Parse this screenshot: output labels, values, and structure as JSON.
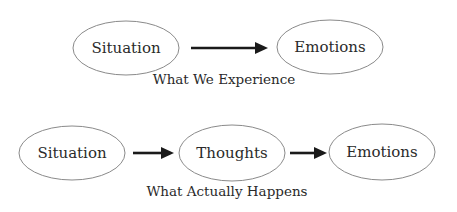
{
  "top_diagram": {
    "caption": "What We Experience",
    "nodes": [
      {
        "label": "Situation"
      },
      {
        "label": "Emotions"
      }
    ]
  },
  "bottom_diagram": {
    "caption": "What Actually Happens",
    "nodes": [
      {
        "label": "Situation"
      },
      {
        "label": "Thoughts"
      },
      {
        "label": "Emotions"
      }
    ]
  },
  "colors": {
    "ellipse_stroke": "#8a8a8a",
    "arrow": "#1a1a1a",
    "text": "#2a2a2a"
  }
}
